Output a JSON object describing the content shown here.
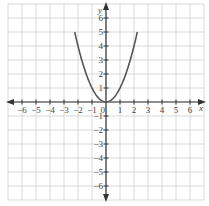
{
  "chart_data": {
    "type": "line",
    "title": "",
    "xlabel": "x",
    "ylabel": "y",
    "xlim": [
      -7,
      7
    ],
    "ylim": [
      -7,
      7
    ],
    "grid": true,
    "x_ticks": [
      -6,
      -5,
      -4,
      -3,
      -2,
      -1,
      0,
      1,
      2,
      3,
      4,
      5,
      6
    ],
    "y_ticks": [
      -6,
      -5,
      -4,
      -3,
      -2,
      -1,
      1,
      2,
      3,
      4,
      5,
      6
    ],
    "x_tick_labels": [
      "−6",
      "−5",
      "−4",
      "−3",
      "−2",
      "−1",
      "0",
      "1",
      "2",
      "3",
      "4",
      "5",
      "6"
    ],
    "y_tick_labels": [
      "−6",
      "−5",
      "−4",
      "−3",
      "−2",
      "−1",
      "1",
      "2",
      "3",
      "4",
      "5",
      "6"
    ],
    "series": [
      {
        "name": "y = x^2",
        "function": "x^2",
        "domain": [
          -2.236,
          2.236
        ],
        "x": [
          -2.236,
          -2,
          -1.5,
          -1,
          -0.5,
          0,
          0.5,
          1,
          1.5,
          2,
          2.236
        ],
        "y": [
          5,
          4,
          2.25,
          1,
          0.25,
          0,
          0.25,
          1,
          2.25,
          4,
          5
        ],
        "color": "#555555"
      }
    ],
    "legend": null
  },
  "colors": {
    "grid": "#d0d0d0",
    "axis": "#333333",
    "curve": "#555555",
    "text": "#444444"
  },
  "layout": {
    "origin_px": [
      106,
      102
    ],
    "unit_px": 14
  }
}
